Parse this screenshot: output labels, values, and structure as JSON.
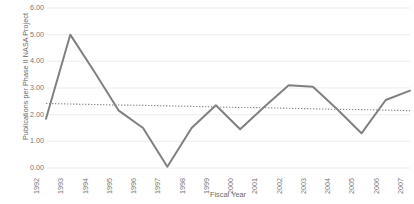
{
  "chart_data": {
    "type": "line",
    "title": "",
    "xlabel": "Fiscal Year",
    "ylabel": "Publications per Phase II NASA Project",
    "categories": [
      "1992",
      "1993",
      "1994",
      "1995",
      "1996",
      "1997",
      "1998",
      "1999",
      "2000",
      "2001",
      "2002",
      "2003",
      "2004",
      "2005",
      "2006",
      "2007"
    ],
    "series": [
      {
        "name": "Publications per Phase II NASA Project",
        "values": [
          1.85,
          5.0,
          3.6,
          2.15,
          1.5,
          0.05,
          1.5,
          2.35,
          1.45,
          2.3,
          3.1,
          3.05,
          2.2,
          1.3,
          2.55,
          2.9
        ],
        "color": "#808080",
        "style": "solid"
      },
      {
        "name": "Trendline",
        "values": [
          2.42,
          2.4,
          2.38,
          2.36,
          2.35,
          2.33,
          2.31,
          2.29,
          2.27,
          2.26,
          2.24,
          2.22,
          2.2,
          2.19,
          2.17,
          2.15
        ],
        "color": "#8a8a8a",
        "style": "dotted"
      }
    ],
    "ylim": [
      0,
      6
    ],
    "ytick_labels": [
      "0.00",
      "1.00",
      "2.00",
      "3.00",
      "4.00",
      "5.00",
      "6.00"
    ],
    "ytick_values": [
      0,
      1,
      2,
      3,
      4,
      5,
      6
    ],
    "grid": true,
    "grid_axis": "y",
    "grid_color": "#ededed",
    "legend": "none",
    "background": "#ffffff"
  }
}
